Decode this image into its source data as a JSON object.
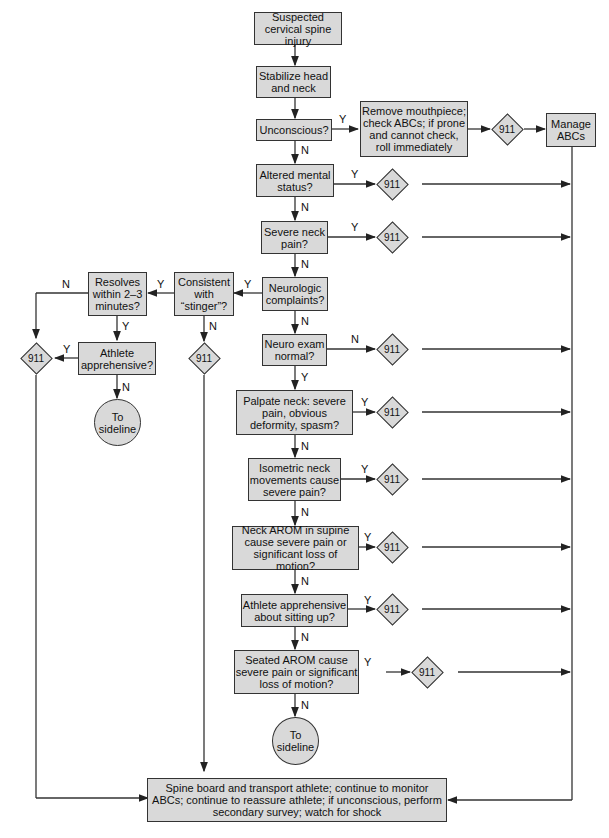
{
  "nodes": {
    "start": "Suspected cervical spine injury",
    "stabilize": "Stabilize head and neck",
    "unconscious": "Unconscious?",
    "remove": "Remove mouthpiece; check ABCs; if prone and cannot check, roll immediately",
    "manage": "Manage ABCs",
    "altered": "Altered mental status?",
    "severe": "Severe neck pain?",
    "neuro": "Neurologic complaints?",
    "stinger": "Consistent with “stinger”?",
    "resolves": "Resolves within 2–3 minutes?",
    "apprehensive": "Athlete apprehensive?",
    "sideline1": "To sideline",
    "neuroexam": "Neuro exam normal?",
    "palpate": "Palpate neck: severe pain, obvious deformity, spasm?",
    "isometric": "Isometric neck movements cause severe pain?",
    "arom": "Neck AROM in supine cause severe pain or significant loss of motion?",
    "sitting": "Athlete apprehensive about sitting up?",
    "seated": "Seated AROM cause severe pain or significant loss of motion?",
    "sideline2": "To sideline",
    "spine": "Spine board and transport athlete; continue to monitor ABCs; continue to reassure athlete; if unconscious, perform secondary survey; watch for shock"
  },
  "emergency": "911",
  "yes": "Y",
  "no": "N"
}
